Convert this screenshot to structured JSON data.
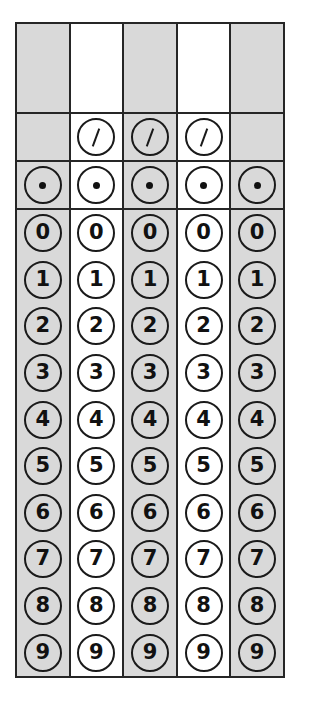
{
  "document": {
    "type": "student-produced-response-grid",
    "title": "Answer Grid",
    "columns_count": 5,
    "column_shading": [
      "shaded",
      "plain",
      "shaded",
      "plain",
      "shaded"
    ],
    "colors": {
      "shaded_fill": "#d9d9d9",
      "plain_fill": "#ffffff",
      "border": "#262626",
      "ink": "#111111",
      "page_background": "#ffffff"
    }
  },
  "entry_row": {
    "name": "answer-entry-boxes",
    "values": [
      "",
      "",
      "",
      "",
      ""
    ]
  },
  "slash_row": {
    "name": "fraction-bar-row",
    "symbol": "/",
    "icon": "slash-icon",
    "present": [
      false,
      true,
      true,
      true,
      false
    ],
    "values": [
      "",
      "/",
      "/",
      "/",
      ""
    ]
  },
  "dot_row": {
    "name": "decimal-point-row",
    "symbol": ".",
    "icon": "dot-icon",
    "present": [
      true,
      true,
      true,
      true,
      true
    ],
    "values": [
      ".",
      ".",
      ".",
      ".",
      "."
    ]
  },
  "digit_rows": [
    {
      "digit": "0",
      "values": [
        "0",
        "0",
        "0",
        "0",
        "0"
      ]
    },
    {
      "digit": "1",
      "values": [
        "1",
        "1",
        "1",
        "1",
        "1"
      ]
    },
    {
      "digit": "2",
      "values": [
        "2",
        "2",
        "2",
        "2",
        "2"
      ]
    },
    {
      "digit": "3",
      "values": [
        "3",
        "3",
        "3",
        "3",
        "3"
      ]
    },
    {
      "digit": "4",
      "values": [
        "4",
        "4",
        "4",
        "4",
        "4"
      ]
    },
    {
      "digit": "5",
      "values": [
        "5",
        "5",
        "5",
        "5",
        "5"
      ]
    },
    {
      "digit": "6",
      "values": [
        "6",
        "6",
        "6",
        "6",
        "6"
      ]
    },
    {
      "digit": "7",
      "values": [
        "7",
        "7",
        "7",
        "7",
        "7"
      ]
    },
    {
      "digit": "8",
      "values": [
        "8",
        "8",
        "8",
        "8",
        "8"
      ]
    },
    {
      "digit": "9",
      "values": [
        "9",
        "9",
        "9",
        "9",
        "9"
      ]
    }
  ]
}
